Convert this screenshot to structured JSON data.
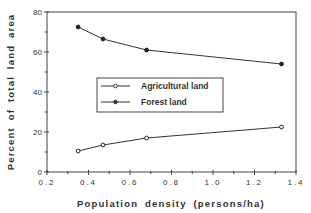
{
  "chart_data": {
    "type": "line",
    "title": "",
    "xlabel": "Population  density  (persons/ha)",
    "ylabel": "Percent  of  total  land  area",
    "xlim": [
      0.2,
      1.4
    ],
    "ylim": [
      0,
      80
    ],
    "xticks": [
      "0.2",
      "0.4",
      "0.6",
      "0.8",
      "1.0",
      "1.2",
      "1.4"
    ],
    "yticks": [
      "0",
      "20",
      "40",
      "60",
      "80"
    ],
    "x": [
      0.35,
      0.47,
      0.68,
      1.33
    ],
    "series": [
      {
        "name": "Agricultural land",
        "marker": "open-circle",
        "values": [
          10.5,
          13.5,
          17,
          22.5
        ]
      },
      {
        "name": "Forest land",
        "marker": "filled-circle",
        "values": [
          72.5,
          66.5,
          61,
          54
        ]
      }
    ],
    "grid": false,
    "legend_position": "center-inside",
    "colors": {
      "line": "#333333",
      "frame": "#444444"
    }
  },
  "legend": {
    "items": [
      {
        "label": "Agricultural land"
      },
      {
        "label": "Forest land"
      }
    ]
  }
}
